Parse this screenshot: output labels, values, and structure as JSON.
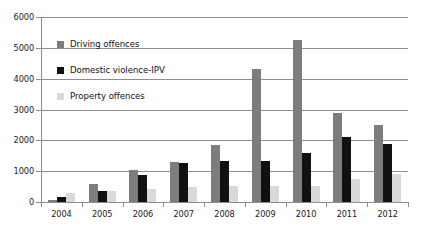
{
  "chart_data": {
    "type": "bar",
    "title": "",
    "xlabel": "",
    "ylabel": "",
    "ylim": [
      0,
      6000
    ],
    "yticks": [
      0,
      1000,
      2000,
      3000,
      4000,
      5000,
      6000
    ],
    "grid": true,
    "legend_position": "inside-top-left",
    "categories": [
      "2004",
      "2005",
      "2006",
      "2007",
      "2008",
      "2009",
      "2010",
      "2011",
      "2012"
    ],
    "series": [
      {
        "name": "Driving offences",
        "color": "#7d7d7d",
        "values": [
          70,
          590,
          1030,
          1300,
          1850,
          4300,
          5250,
          2880,
          2500
        ]
      },
      {
        "name": "Domestic violence-IPV",
        "color": "#111111",
        "values": [
          160,
          350,
          890,
          1270,
          1330,
          1320,
          1580,
          2100,
          1880
        ]
      },
      {
        "name": "Property offences",
        "color": "#d9d9d9",
        "values": [
          300,
          350,
          420,
          500,
          520,
          520,
          520,
          760,
          900
        ]
      }
    ]
  }
}
